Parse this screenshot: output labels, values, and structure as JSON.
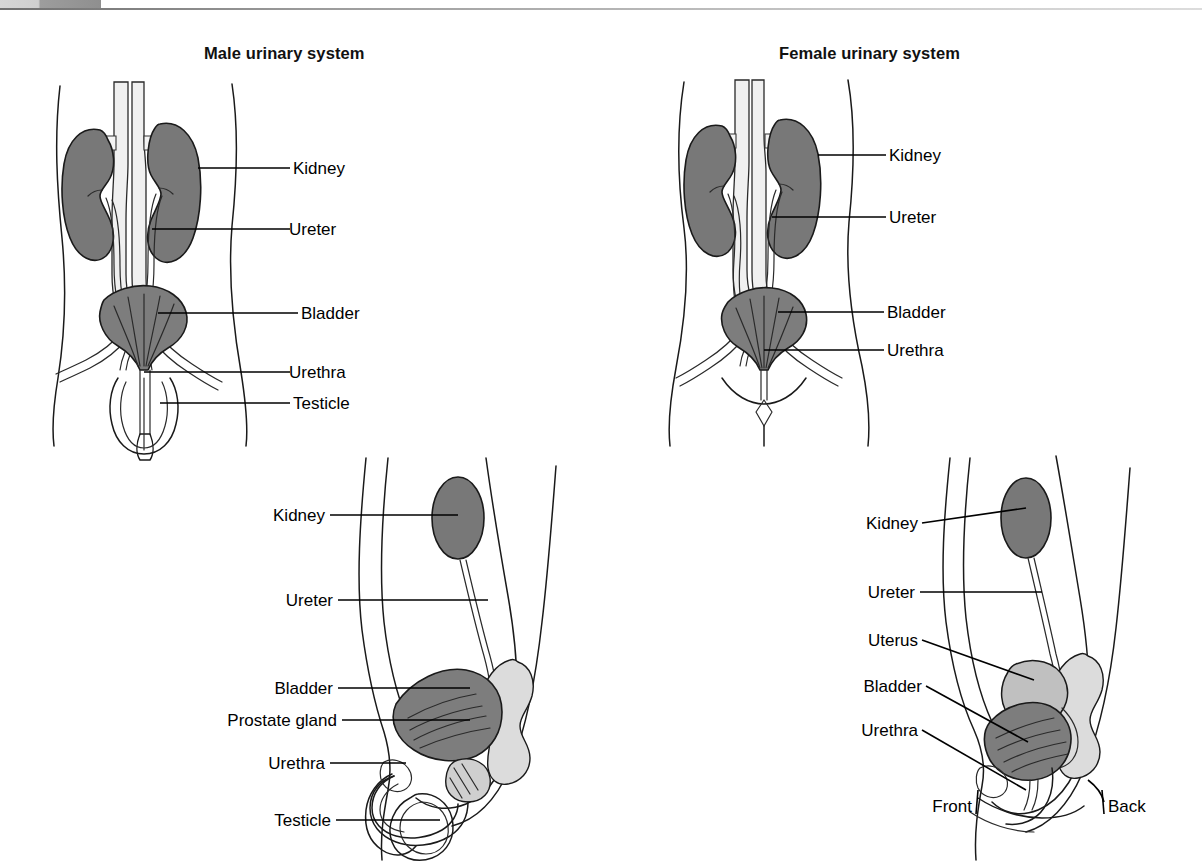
{
  "page": {
    "background_color": "#ffffff",
    "top_bar_color": "#8f8f8f",
    "rule_color": "#6f6f6f"
  },
  "panels": {
    "male_front": {
      "title": "Male urinary system",
      "labels": [
        {
          "text": "Kidney",
          "y": 168
        },
        {
          "text": "Ureter",
          "y": 229
        },
        {
          "text": "Bladder",
          "y": 313
        },
        {
          "text": "Urethra",
          "y": 372
        },
        {
          "text": "Testicle",
          "y": 403
        }
      ]
    },
    "female_front": {
      "title": "Female urinary system",
      "labels": [
        {
          "text": "Kidney",
          "y": 155
        },
        {
          "text": "Ureter",
          "y": 217
        },
        {
          "text": "Bladder",
          "y": 312
        },
        {
          "text": "Urethra",
          "y": 350
        }
      ]
    },
    "male_side": {
      "title": "",
      "labels": [
        {
          "text": "Kidney",
          "y": 515
        },
        {
          "text": "Ureter",
          "y": 600
        },
        {
          "text": "Bladder",
          "y": 688
        },
        {
          "text": "Prostate gland",
          "y": 720
        },
        {
          "text": "Urethra",
          "y": 763
        },
        {
          "text": "Testicle",
          "y": 820
        }
      ]
    },
    "female_side": {
      "title": "",
      "labels": [
        {
          "text": "Kidney",
          "y": 521
        },
        {
          "text": "Ureter",
          "y": 590
        },
        {
          "text": "Uterus",
          "y": 640
        },
        {
          "text": "Bladder",
          "y": 685
        },
        {
          "text": "Urethra",
          "y": 727
        }
      ],
      "orientation": {
        "front": "Front",
        "back": "Back"
      }
    }
  },
  "organ_colors": {
    "kidney": "#787878",
    "bladder": "#7d7d7d",
    "uterus": "#c0c0c0",
    "rectum": "#dcdcdc",
    "prostate": "#cfcfcf",
    "outline": "#1a1a1a"
  }
}
